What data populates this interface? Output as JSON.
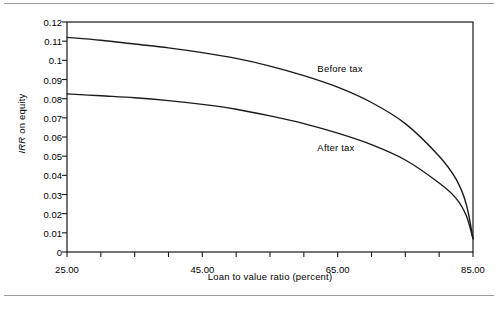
{
  "figure": {
    "background": "#ffffff",
    "line_color": "#1a1a1a",
    "rule_color": "#9a9a9a"
  },
  "chart_data": {
    "type": "line",
    "title": "",
    "xlabel": "Loan to value ratio (percent)",
    "ylabel": "IRR on equity",
    "ylabel_italic_part": "IRR",
    "ylabel_rest_part": " on equity",
    "xlim": [
      25.0,
      85.0
    ],
    "ylim": [
      0,
      0.12
    ],
    "grid": false,
    "legend_position": "inline-annotation",
    "xticks": [
      25,
      30,
      35,
      40,
      45,
      50,
      55,
      60,
      65,
      70,
      75,
      80,
      85
    ],
    "xtick_labels": [
      "25.00",
      "",
      "",
      "",
      "45.00",
      "",
      "",
      "",
      "65.00",
      "",
      "",
      "",
      "85.00"
    ],
    "xtick_labels_shown": [
      "25.00",
      "45.00",
      "65.00",
      "85.00"
    ],
    "yticks": [
      0,
      0.01,
      0.02,
      0.03,
      0.04,
      0.05,
      0.06,
      0.07,
      0.08,
      0.09,
      0.1,
      0.11,
      0.12
    ],
    "ytick_labels": [
      "0",
      "0.01",
      "0.02",
      "0.03",
      "0.04",
      "0.05",
      "0.06",
      "0.07",
      "0.08",
      "0.09",
      "0.1",
      "0.11",
      "0.12"
    ],
    "x": [
      25,
      30,
      35,
      40,
      45,
      50,
      55,
      60,
      65,
      70,
      75,
      80,
      82.5,
      84,
      85
    ],
    "series": [
      {
        "name": "Before tax",
        "label": "Before tax",
        "values": [
          0.112,
          0.1105,
          0.1085,
          0.1065,
          0.104,
          0.101,
          0.097,
          0.092,
          0.086,
          0.078,
          0.067,
          0.05,
          0.038,
          0.025,
          0.007
        ],
        "annotation_x": 62,
        "annotation_y": 0.0955
      },
      {
        "name": "After tax",
        "label": "After tax",
        "values": [
          0.0825,
          0.0815,
          0.0805,
          0.079,
          0.077,
          0.0745,
          0.071,
          0.067,
          0.062,
          0.056,
          0.048,
          0.036,
          0.028,
          0.019,
          0.007
        ],
        "annotation_x": 62,
        "annotation_y": 0.0545
      }
    ]
  }
}
